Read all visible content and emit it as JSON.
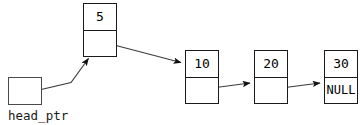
{
  "diagram": {
    "pointer": {
      "label": "head_ptr",
      "box_value": ""
    },
    "nodes": [
      {
        "id": "node-5",
        "value": "5",
        "next_text": ""
      },
      {
        "id": "node-10",
        "value": "10",
        "next_text": ""
      },
      {
        "id": "node-20",
        "value": "20",
        "next_text": ""
      },
      {
        "id": "node-30",
        "value": "30",
        "next_text": "NULL"
      }
    ],
    "edges": [
      {
        "name": "head-ptr-to-node-5",
        "from": "head_ptr",
        "to": "5"
      },
      {
        "name": "node-5-to-node-10",
        "from": "5",
        "to": "10"
      },
      {
        "name": "node-10-to-node-20",
        "from": "10",
        "to": "20"
      },
      {
        "name": "node-20-to-node-30",
        "from": "20",
        "to": "30"
      }
    ],
    "colors": {
      "stroke": "#1a1a1a",
      "pointer_stroke": "#4a4a4a",
      "fill": "#ffffff",
      "text": "#000000"
    }
  }
}
